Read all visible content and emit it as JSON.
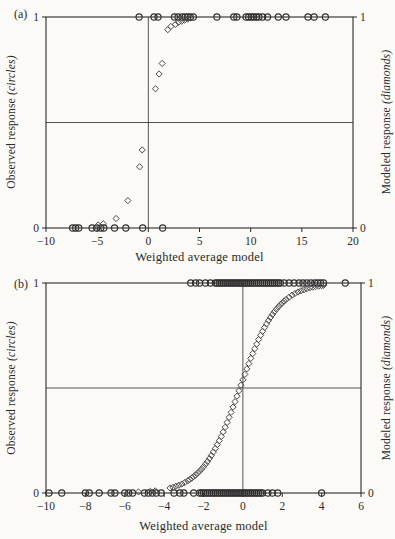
{
  "figure": {
    "background": "#fbfaf7",
    "ink_color": "#2a2a2a",
    "circle_color": "#2f2d2d",
    "diamond_color": "#4c4a4a"
  },
  "chart_data": [
    {
      "id": "a",
      "type": "scatter",
      "panel_label": "(a)",
      "xlabel": "Weighted average model",
      "ylabel_left": {
        "main": "Observed response ",
        "em": "(circles)"
      },
      "ylabel_right": {
        "main": "Modeled response ",
        "em": "(diamonds)"
      },
      "xlim": [
        -10,
        20
      ],
      "xticks": [
        -10,
        -5,
        0,
        5,
        10,
        15,
        20
      ],
      "ylim": [
        0,
        1
      ],
      "yticks": [
        0,
        1
      ],
      "refline_x": 0,
      "refline_y": 0.5,
      "grid": false,
      "series": [
        {
          "name": "observed-response",
          "marker": "circle",
          "points": [
            [
              -0.9,
              1
            ],
            [
              0.55,
              1
            ],
            [
              0.95,
              1
            ],
            [
              2.55,
              1
            ],
            [
              2.9,
              1
            ],
            [
              3.3,
              1
            ],
            [
              3.6,
              1
            ],
            [
              3.85,
              1
            ],
            [
              4.1,
              1
            ],
            [
              4.4,
              1
            ],
            [
              6.7,
              1
            ],
            [
              8.35,
              1
            ],
            [
              8.65,
              1
            ],
            [
              9.55,
              1
            ],
            [
              9.8,
              1
            ],
            [
              10.05,
              1
            ],
            [
              10.3,
              1
            ],
            [
              10.55,
              1
            ],
            [
              10.8,
              1
            ],
            [
              11.15,
              1
            ],
            [
              11.65,
              1
            ],
            [
              12.7,
              1
            ],
            [
              13.45,
              1
            ],
            [
              15.6,
              1
            ],
            [
              16.2,
              1
            ],
            [
              17.3,
              1
            ],
            [
              -7.4,
              0
            ],
            [
              -7.1,
              0
            ],
            [
              -6.8,
              0
            ],
            [
              -5.5,
              0
            ],
            [
              -5.05,
              0
            ],
            [
              -4.65,
              0
            ],
            [
              -4.35,
              0
            ],
            [
              -3.3,
              0
            ],
            [
              -2.2,
              0
            ],
            [
              -0.55,
              0
            ],
            [
              1.4,
              0
            ]
          ]
        },
        {
          "name": "modeled-response",
          "marker": "diamond",
          "points": [
            [
              -4.9,
              0.015
            ],
            [
              -4.4,
              0.02
            ],
            [
              -3.15,
              0.045
            ],
            [
              -2.0,
              0.13
            ],
            [
              -0.85,
              0.29
            ],
            [
              -0.6,
              0.37
            ],
            [
              0.7,
              0.66
            ],
            [
              1.05,
              0.73
            ],
            [
              1.35,
              0.78
            ],
            [
              1.9,
              0.94
            ],
            [
              2.2,
              0.955
            ],
            [
              2.65,
              0.965
            ],
            [
              2.95,
              0.975
            ],
            [
              3.25,
              0.98
            ],
            [
              3.55,
              0.985
            ],
            [
              3.85,
              0.99
            ],
            [
              4.15,
              0.995
            ]
          ]
        }
      ]
    },
    {
      "id": "b",
      "type": "scatter",
      "panel_label": "(b)",
      "xlabel": "Weighted average model",
      "ylabel_left": {
        "main": "Observed response ",
        "em": "(circles)"
      },
      "ylabel_right": {
        "main": "Modeled response ",
        "em": "(diamonds)"
      },
      "xlim": [
        -10,
        6
      ],
      "xticks": [
        -10,
        -8,
        -6,
        -4,
        -2,
        0,
        2,
        4,
        6
      ],
      "ylim": [
        0,
        1
      ],
      "yticks": [
        0,
        1
      ],
      "refline_x": 0,
      "refline_y": 0.5,
      "grid": false,
      "series": [
        {
          "name": "observed-response",
          "marker": "circle",
          "points": [
            [
              -2.65,
              1
            ],
            [
              -2.4,
              1
            ],
            [
              -2.2,
              1
            ],
            [
              -1.9,
              1
            ],
            [
              -1.65,
              1
            ],
            [
              -1.4,
              1
            ],
            [
              -1.3,
              1
            ],
            [
              -1.2,
              1
            ],
            [
              -1.1,
              1
            ],
            [
              -1.0,
              1
            ],
            [
              -0.9,
              1
            ],
            [
              -0.8,
              1
            ],
            [
              -0.7,
              1
            ],
            [
              -0.6,
              1
            ],
            [
              -0.5,
              1
            ],
            [
              -0.4,
              1
            ],
            [
              -0.3,
              1
            ],
            [
              -0.2,
              1
            ],
            [
              -0.1,
              1
            ],
            [
              0.0,
              1
            ],
            [
              0.1,
              1
            ],
            [
              0.2,
              1
            ],
            [
              0.3,
              1
            ],
            [
              0.4,
              1
            ],
            [
              0.5,
              1
            ],
            [
              0.6,
              1
            ],
            [
              0.7,
              1
            ],
            [
              0.8,
              1
            ],
            [
              0.9,
              1
            ],
            [
              1.0,
              1
            ],
            [
              1.1,
              1
            ],
            [
              1.2,
              1
            ],
            [
              1.3,
              1
            ],
            [
              1.4,
              1
            ],
            [
              1.5,
              1
            ],
            [
              1.6,
              1
            ],
            [
              1.7,
              1
            ],
            [
              1.8,
              1
            ],
            [
              1.9,
              1
            ],
            [
              2.1,
              1
            ],
            [
              2.35,
              1
            ],
            [
              2.6,
              1
            ],
            [
              2.85,
              1
            ],
            [
              3.05,
              1
            ],
            [
              3.25,
              1
            ],
            [
              3.45,
              1
            ],
            [
              3.65,
              1
            ],
            [
              3.8,
              1
            ],
            [
              3.95,
              1
            ],
            [
              4.1,
              1
            ],
            [
              5.2,
              1
            ],
            [
              -9.85,
              0
            ],
            [
              -9.2,
              0
            ],
            [
              -8.0,
              0
            ],
            [
              -7.8,
              0
            ],
            [
              -7.3,
              0
            ],
            [
              -6.7,
              0
            ],
            [
              -6.5,
              0
            ],
            [
              -6.0,
              0
            ],
            [
              -5.8,
              0
            ],
            [
              -5.6,
              0
            ],
            [
              -5.0,
              0
            ],
            [
              -4.8,
              0
            ],
            [
              -4.6,
              0
            ],
            [
              -4.4,
              0
            ],
            [
              -4.15,
              0
            ],
            [
              -3.5,
              0
            ],
            [
              -3.2,
              0
            ],
            [
              -3.0,
              0
            ],
            [
              -2.5,
              0
            ],
            [
              -2.2,
              0
            ],
            [
              -2.1,
              0
            ],
            [
              -2.0,
              0
            ],
            [
              -1.9,
              0
            ],
            [
              -1.8,
              0
            ],
            [
              -1.7,
              0
            ],
            [
              -1.6,
              0
            ],
            [
              -1.5,
              0
            ],
            [
              -1.4,
              0
            ],
            [
              -1.3,
              0
            ],
            [
              -1.2,
              0
            ],
            [
              -1.1,
              0
            ],
            [
              -1.0,
              0
            ],
            [
              -0.9,
              0
            ],
            [
              -0.8,
              0
            ],
            [
              -0.7,
              0
            ],
            [
              -0.6,
              0
            ],
            [
              -0.5,
              0
            ],
            [
              -0.4,
              0
            ],
            [
              -0.3,
              0
            ],
            [
              -0.2,
              0
            ],
            [
              -0.1,
              0
            ],
            [
              0.0,
              0
            ],
            [
              0.1,
              0
            ],
            [
              0.2,
              0
            ],
            [
              0.3,
              0
            ],
            [
              0.4,
              0
            ],
            [
              0.5,
              0
            ],
            [
              0.6,
              0
            ],
            [
              0.7,
              0
            ],
            [
              0.8,
              0
            ],
            [
              0.9,
              0
            ],
            [
              1.0,
              0
            ],
            [
              1.27,
              0
            ],
            [
              1.5,
              0
            ],
            [
              1.77,
              0
            ],
            [
              4.0,
              0
            ]
          ]
        },
        {
          "name": "modeled-response",
          "marker": "diamond",
          "points": [
            [
              -5.3,
              0.005
            ],
            [
              -4.7,
              0.008
            ],
            [
              -4.45,
              0.01
            ],
            [
              -3.7,
              0.024
            ],
            [
              -3.55,
              0.027
            ],
            [
              -3.4,
              0.032
            ],
            [
              -3.25,
              0.037
            ],
            [
              -3.1,
              0.043
            ],
            [
              -2.95,
              0.05
            ],
            [
              -2.8,
              0.058
            ],
            [
              -2.7,
              0.064
            ],
            [
              -2.6,
              0.071
            ],
            [
              -2.5,
              0.078
            ],
            [
              -2.4,
              0.086
            ],
            [
              -2.3,
              0.095
            ],
            [
              -2.2,
              0.104
            ],
            [
              -2.1,
              0.114
            ],
            [
              -2.0,
              0.125
            ],
            [
              -1.9,
              0.137
            ],
            [
              -1.8,
              0.15
            ],
            [
              -1.7,
              0.164
            ],
            [
              -1.6,
              0.179
            ],
            [
              -1.5,
              0.195
            ],
            [
              -1.4,
              0.212
            ],
            [
              -1.3,
              0.23
            ],
            [
              -1.2,
              0.249
            ],
            [
              -1.1,
              0.269
            ],
            [
              -1.0,
              0.291
            ],
            [
              -0.9,
              0.313
            ],
            [
              -0.8,
              0.336
            ],
            [
              -0.7,
              0.36
            ],
            [
              -0.6,
              0.384
            ],
            [
              -0.5,
              0.409
            ],
            [
              -0.4,
              0.435
            ],
            [
              -0.3,
              0.461
            ],
            [
              -0.2,
              0.487
            ],
            [
              -0.1,
              0.513
            ],
            [
              0.0,
              0.539
            ],
            [
              0.1,
              0.565
            ],
            [
              0.2,
              0.591
            ],
            [
              0.3,
              0.616
            ],
            [
              0.4,
              0.641
            ],
            [
              0.5,
              0.664
            ],
            [
              0.6,
              0.687
            ],
            [
              0.7,
              0.709
            ],
            [
              0.8,
              0.731
            ],
            [
              0.9,
              0.751
            ],
            [
              1.0,
              0.77
            ],
            [
              1.1,
              0.788
            ],
            [
              1.2,
              0.805
            ],
            [
              1.3,
              0.821
            ],
            [
              1.4,
              0.836
            ],
            [
              1.5,
              0.85
            ],
            [
              1.6,
              0.863
            ],
            [
              1.7,
              0.875
            ],
            [
              1.8,
              0.886
            ],
            [
              1.9,
              0.896
            ],
            [
              2.0,
              0.905
            ],
            [
              2.1,
              0.914
            ],
            [
              2.2,
              0.922
            ],
            [
              2.35,
              0.932
            ],
            [
              2.5,
              0.942
            ],
            [
              2.65,
              0.95
            ],
            [
              2.8,
              0.957
            ],
            [
              2.95,
              0.963
            ],
            [
              3.1,
              0.968
            ],
            [
              3.25,
              0.973
            ],
            [
              3.4,
              0.977
            ],
            [
              3.55,
              0.98
            ],
            [
              3.7,
              0.983
            ],
            [
              3.85,
              0.985
            ],
            [
              4.0,
              0.987
            ],
            [
              4.1,
              0.989
            ]
          ]
        }
      ]
    }
  ]
}
